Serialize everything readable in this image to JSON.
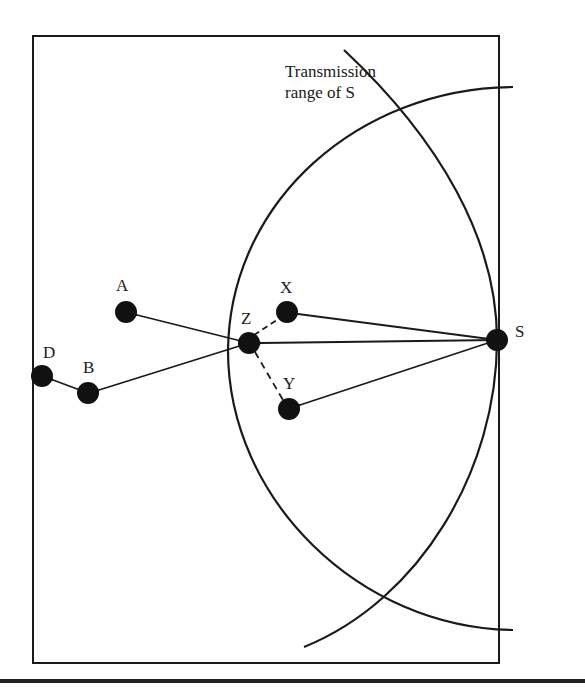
{
  "diagram": {
    "annotation": {
      "line1": "Transmission",
      "line2": "range of S"
    },
    "nodes": [
      {
        "id": "A",
        "label": "A",
        "x": 126,
        "y": 312
      },
      {
        "id": "X",
        "label": "X",
        "x": 287,
        "y": 312
      },
      {
        "id": "Z",
        "label": "Z",
        "x": 249,
        "y": 343
      },
      {
        "id": "S",
        "label": "S",
        "x": 497,
        "y": 340
      },
      {
        "id": "Y",
        "label": "Y",
        "x": 289,
        "y": 409
      },
      {
        "id": "B",
        "label": "B",
        "x": 88,
        "y": 393
      },
      {
        "id": "D",
        "label": "D",
        "x": 42,
        "y": 376
      }
    ],
    "edges": [
      {
        "from": "S",
        "to": "X",
        "style": "solid"
      },
      {
        "from": "S",
        "to": "Z",
        "style": "solid"
      },
      {
        "from": "S",
        "to": "Y",
        "style": "solid"
      },
      {
        "from": "Z",
        "to": "X",
        "style": "dashed"
      },
      {
        "from": "Z",
        "to": "Y",
        "style": "dashed"
      },
      {
        "from": "Z",
        "to": "A",
        "style": "solid"
      },
      {
        "from": "Z",
        "to": "B",
        "style": "solid"
      },
      {
        "from": "B",
        "to": "D",
        "style": "solid"
      }
    ],
    "colors": {
      "stroke": "#1a1a1a",
      "background": "#ffffff"
    }
  }
}
